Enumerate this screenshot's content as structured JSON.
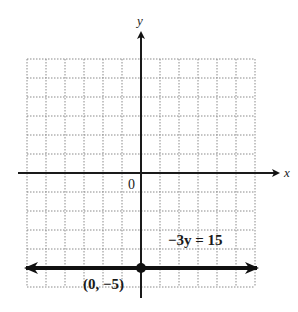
{
  "chart_data": {
    "type": "line",
    "title": "",
    "xlabel": "x",
    "ylabel": "y",
    "xlim": [
      -6,
      6
    ],
    "ylim": [
      -6,
      6
    ],
    "grid": true,
    "grid_style": "dotted",
    "origin_label": "0",
    "series": [
      {
        "name": "−3y = 15",
        "equation": "-3y = 15",
        "kind": "horizontal line with arrows both ends",
        "x": [
          -6,
          6
        ],
        "y": [
          -5,
          -5
        ]
      }
    ],
    "points": [
      {
        "x": 0,
        "y": -5,
        "label": "(0, −5)"
      }
    ],
    "annotations": [
      {
        "text": "−3y = 15",
        "x": 2.4,
        "y": -3.5
      },
      {
        "text": "(0, −5)",
        "x": -1.5,
        "y": -5.8
      }
    ]
  },
  "labels": {
    "x_axis": "x",
    "y_axis": "y",
    "origin": "0",
    "equation": "−3y = 15",
    "point": "(0, −5)"
  },
  "colors": {
    "axis": "#1a1a1a",
    "grid": "#8a8a8a",
    "line": "#111111",
    "background": "#ffffff"
  }
}
